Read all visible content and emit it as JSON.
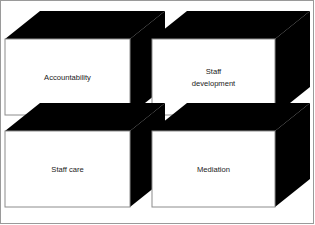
{
  "diagram": {
    "layout": "2x2",
    "style": {
      "front_face_color": "#ffffff",
      "front_face_border": "#8c8c8c",
      "shadow_face_color": "#000000",
      "frame_border_color": "#9a9a9a",
      "background": "#ffffff",
      "label_color": "#1a1a1a"
    },
    "blocks": [
      {
        "id": "accountability",
        "position": "top-left",
        "label": "Accountability",
        "label_lines": [
          "Accountability"
        ]
      },
      {
        "id": "staff-development",
        "position": "top-right",
        "label": "Staff development",
        "label_lines": [
          "Staff",
          "development"
        ]
      },
      {
        "id": "staff-care",
        "position": "bottom-left",
        "label": "Staff care",
        "label_lines": [
          "Staff care"
        ]
      },
      {
        "id": "mediation",
        "position": "bottom-right",
        "label": "Mediation",
        "label_lines": [
          "Mediation"
        ]
      }
    ]
  }
}
